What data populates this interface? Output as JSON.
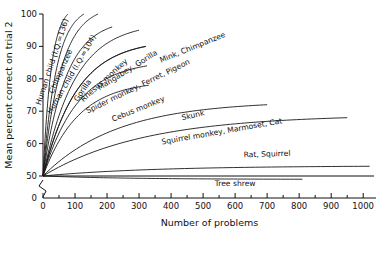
{
  "chart_data": {
    "type": "line",
    "title": "",
    "xlabel": "Number of problems",
    "ylabel": "Mean percent correct on trial 2",
    "xlim": [
      0,
      1040
    ],
    "ylim": [
      50,
      100
    ],
    "y_axis_break": true,
    "y_zero_label": "0",
    "grid": false,
    "legend": "inline-curve-labels",
    "xticks": [
      0,
      100,
      200,
      300,
      400,
      500,
      600,
      700,
      800,
      900,
      1000
    ],
    "xticklabels": [
      "0",
      "100",
      "200",
      "300",
      "400",
      "500",
      "600",
      "700",
      "800",
      "900",
      "1000"
    ],
    "x_minor_ticks": [
      50,
      150,
      250,
      350,
      450,
      550,
      650,
      750,
      850,
      950
    ],
    "yticks": [
      50,
      60,
      70,
      80,
      90,
      100
    ],
    "yticklabels": [
      "50",
      "60",
      "70",
      "80",
      "90",
      "100"
    ],
    "origin": {
      "x": 0,
      "y": 50
    },
    "series": [
      {
        "name": "Human child (I.Q.=136)",
        "label": "Human child (I.Q.=136)",
        "x_end": 78,
        "y_end": 100,
        "label_angle": -72,
        "label_x": 36,
        "label_y": 85
      },
      {
        "name": "Chimpanzee",
        "label": "Chimpanzee",
        "x_end": 128,
        "y_end": 100,
        "label_angle": -66,
        "label_x": 62,
        "label_y": 82
      },
      {
        "name": "Human child (I.Q.=104)",
        "label": "Human child (I.Q.=104)",
        "x_end": 172,
        "y_end": 100,
        "label_angle": -60,
        "label_x": 96,
        "label_y": 81
      },
      {
        "name": "Gorilla",
        "label": "Gorilla",
        "x_end": 216,
        "y_end": 96,
        "label_angle": -56,
        "label_x": 130,
        "label_y": 76
      },
      {
        "name": "Rhesus monkey",
        "label": "Rhesus monkey",
        "x_end": 300,
        "y_end": 95,
        "label_angle": -42,
        "label_x": 196,
        "label_y": 79
      },
      {
        "name": "Mangabey, Gorilla",
        "label": "Mangabey, Gorilla",
        "x_end": 320,
        "y_end": 90,
        "label_angle": -32,
        "label_x": 268,
        "label_y": 82
      },
      {
        "name": "Mink, Chimpanzee",
        "label": "Mink, Chimpanzee",
        "x_end": 322,
        "y_end": 90,
        "label_angle": -22,
        "label_x": 470,
        "label_y": 89
      },
      {
        "name": "Spider monkey, Ferret, Pigeon",
        "label": "Spider monkey, Ferret, Pigeon",
        "x_end": 325,
        "y_end": 84,
        "label_angle": -26,
        "label_x": 300,
        "label_y": 77
      },
      {
        "name": "Cebus monkey",
        "label": "Cebus monkey",
        "x_end": 330,
        "y_end": 78,
        "label_angle": -22,
        "label_x": 300,
        "label_y": 70
      },
      {
        "name": "Skunk",
        "label": "Skunk",
        "x_end": 700,
        "y_end": 72,
        "label_angle": -13,
        "label_x": 470,
        "label_y": 68
      },
      {
        "name": "Squirrel monkey, Marmoset, Cat",
        "label": "Squirrel monkey, Marmoset, Cat",
        "x_end": 950,
        "y_end": 68,
        "label_angle": -10,
        "label_x": 560,
        "label_y": 63
      },
      {
        "name": "Rat, Squirrel",
        "label": "Rat, Squirrel",
        "x_end": 1020,
        "y_end": 53,
        "label_angle": -2,
        "label_x": 700,
        "label_y": 56
      },
      {
        "name": "Tree shrew",
        "label": "Tree shrew",
        "x_end": 810,
        "y_end": 49,
        "label_angle": 0,
        "label_x": 600,
        "label_y": 47
      }
    ]
  }
}
